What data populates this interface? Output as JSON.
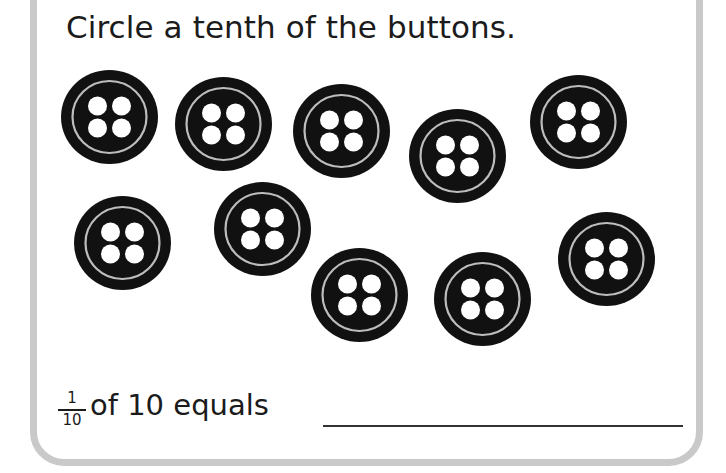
{
  "worksheet": {
    "instruction": "Circle a tenth of the buttons.",
    "fraction": {
      "numerator": "1",
      "denominator": "10"
    },
    "answer_prompt": "of 10 equals",
    "answer_value": "",
    "colors": {
      "frame_border": "#c9c9c9",
      "button_fill": "#111111",
      "button_ring": "#bdbdbd",
      "button_holes": "#ffffff"
    }
  },
  "buttons": [
    {
      "id": 1,
      "cx": 109,
      "cy": 117,
      "holes": 4
    },
    {
      "id": 2,
      "cx": 223,
      "cy": 124,
      "holes": 4
    },
    {
      "id": 3,
      "cx": 341,
      "cy": 131,
      "holes": 4
    },
    {
      "id": 4,
      "cx": 457,
      "cy": 156,
      "holes": 4
    },
    {
      "id": 5,
      "cx": 578,
      "cy": 122,
      "holes": 4
    },
    {
      "id": 6,
      "cx": 122,
      "cy": 243,
      "holes": 4
    },
    {
      "id": 7,
      "cx": 262,
      "cy": 229,
      "holes": 4
    },
    {
      "id": 8,
      "cx": 359,
      "cy": 295,
      "holes": 4
    },
    {
      "id": 9,
      "cx": 482,
      "cy": 299,
      "holes": 4
    },
    {
      "id": 10,
      "cx": 606,
      "cy": 259,
      "holes": 4
    }
  ],
  "button_count": 10
}
